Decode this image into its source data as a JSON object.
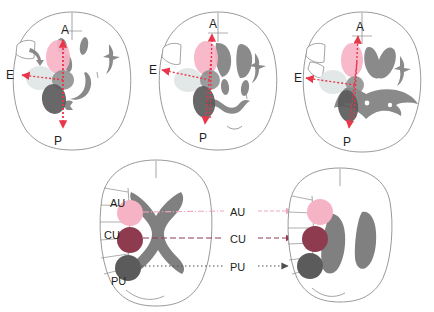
{
  "figure": {
    "type": "anatomical-diagram",
    "background_color": "#ffffff",
    "outline_color": "#8d8d8d",
    "text_color": "#231f20"
  },
  "colors": {
    "au_pink": "#f7b3c6",
    "cu_maroon": "#8e3b50",
    "pu_dark_gray": "#5b5b5b",
    "ventricle_gray": "#808080",
    "mid_gray_blob": "#8a8a8a",
    "pale_gray_blob": "#dfe4e6",
    "arrow_red": "#e8374a",
    "outline": "#8d8d8d"
  },
  "axis_labels": {
    "anterior": "A",
    "posterior": "P",
    "lateral": "E"
  },
  "region_labels": {
    "au": "AU",
    "cu": "CU",
    "pu": "PU"
  },
  "top_panels": [
    {
      "id": "axial-1",
      "axis": {
        "anterior": "A",
        "posterior": "P",
        "lateral": "E"
      },
      "blobs": [
        "au_pink",
        "pale_gray",
        "mid_gray",
        "pu_dark"
      ]
    },
    {
      "id": "axial-2",
      "axis": {
        "anterior": "A",
        "posterior": "P",
        "lateral": "E"
      },
      "blobs": [
        "au_pink",
        "pale_gray",
        "mid_gray",
        "pu_dark"
      ]
    },
    {
      "id": "axial-3",
      "axis": {
        "anterior": "A",
        "posterior": "P",
        "lateral": "E"
      },
      "blobs": [
        "au_pink",
        "pale_gray",
        "mid_gray",
        "pu_dark"
      ]
    }
  ],
  "bottom_panels": [
    {
      "id": "coronal-left",
      "labels": [
        "AU",
        "CU",
        "PU"
      ],
      "label_side": "left"
    },
    {
      "id": "coronal-right",
      "labels": [
        "AU",
        "CU",
        "PU"
      ],
      "label_side": "left"
    }
  ],
  "connectors": [
    {
      "label": "AU",
      "style": "dash-dot",
      "color": "#f0a8bd"
    },
    {
      "label": "CU",
      "style": "dashed",
      "color": "#7d3murkey"
    },
    {
      "label": "PU",
      "style": "dotted",
      "color": "#4f4f4f"
    }
  ]
}
